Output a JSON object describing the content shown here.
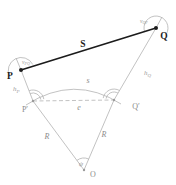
{
  "figure": {
    "kind": "geodesy-distance-reduction-diagram",
    "points": {
      "P": "P",
      "Q": "Q",
      "P_prime": "P′",
      "Q_prime": "Q′",
      "O": "O"
    },
    "edges": {
      "slope_distance": "S",
      "surface_arc": "s",
      "chord": "e",
      "radius_left": "R",
      "radius_right": "R"
    },
    "angles": {
      "central": "ψ",
      "zenith_at_P": {
        "base": "v",
        "sub": "PQ"
      },
      "zenith_at_Q": {
        "base": "v",
        "sub": "QP"
      }
    },
    "heights": {
      "h_P": {
        "base": "h",
        "sub": "P"
      },
      "h_Q": {
        "base": "h",
        "sub": "Q"
      }
    },
    "colors": {
      "ink": "#1c1c1c",
      "construction_gray": "#b3b3b3",
      "label_gray": "#8c8c8c",
      "background": "#ffffff"
    }
  }
}
